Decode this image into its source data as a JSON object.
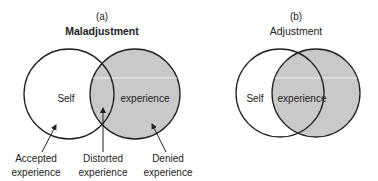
{
  "panels": [
    {
      "letter": "(a)",
      "title": "Maladjustment",
      "self_label": "Self",
      "experience_label": "experience",
      "callouts": [
        {
          "line1": "Accepted",
          "line2": "experience"
        },
        {
          "line1": "Distorted",
          "line2": "experience"
        },
        {
          "line1": "Denied",
          "line2": "experience"
        }
      ]
    },
    {
      "letter": "(b)",
      "title": "Adjustment",
      "self_label": "Self",
      "experience_label": "experience"
    }
  ],
  "colors": {
    "stroke": "#222222",
    "experience_fill": "#c9c9c9",
    "self_fill": "#ffffff",
    "highlight_line": "#f2f2f2"
  }
}
